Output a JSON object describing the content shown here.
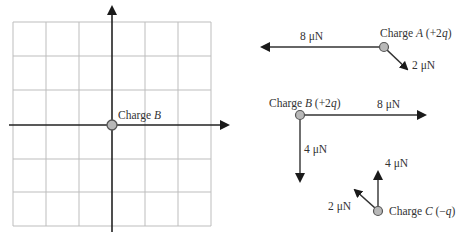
{
  "left_panel": {
    "grid": {
      "columns": 6,
      "rows": 6,
      "cell_size_px": 33
    },
    "axes": {
      "x_axis": "horizontal arrow",
      "y_axis": "vertical arrow"
    },
    "origin_charge_label_prefix": "Charge ",
    "origin_charge_name": "B"
  },
  "right_panel": {
    "charge_a": {
      "label_prefix": "Charge ",
      "name": "A",
      "charge_open": " (+2",
      "charge_var": "q",
      "charge_close": ")",
      "forces": [
        {
          "label": "8 μN",
          "direction": "left"
        },
        {
          "label": "2 μN",
          "direction": "down-right"
        }
      ]
    },
    "charge_b": {
      "label_prefix": "Charge ",
      "name": "B",
      "charge_open": " (+2",
      "charge_var": "q",
      "charge_close": ")",
      "forces": [
        {
          "label": "8 μN",
          "direction": "right"
        },
        {
          "label": "4 μN",
          "direction": "down"
        }
      ]
    },
    "charge_c": {
      "label_prefix": "Charge ",
      "name": "C",
      "charge_open": " (−",
      "charge_var": "q",
      "charge_close": ")",
      "forces": [
        {
          "label": "4 μN",
          "direction": "up"
        },
        {
          "label": "2 μN",
          "direction": "up-left"
        }
      ]
    }
  },
  "colors": {
    "grid_line": "#bdbdbd",
    "axis": "#222222",
    "charge_fill": "#b8b8b8",
    "charge_stroke": "#555555",
    "text": "#333333"
  }
}
